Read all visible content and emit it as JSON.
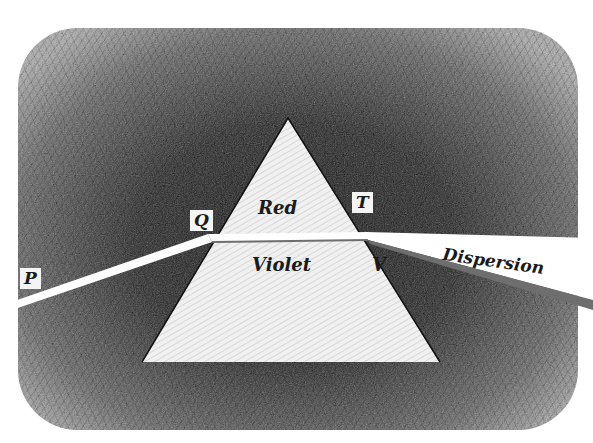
{
  "figure": {
    "labels": {
      "p": "P",
      "q": "Q",
      "t": "T",
      "red": "Red",
      "violet": "Violet",
      "v": "V",
      "dispersion": "Dispersion"
    },
    "colors": {
      "background_hatch": "#3a3a3a",
      "prism_fill": "#eeeeee",
      "beam": "#ffffff",
      "beam_shadow": "#6e6e6e"
    }
  }
}
